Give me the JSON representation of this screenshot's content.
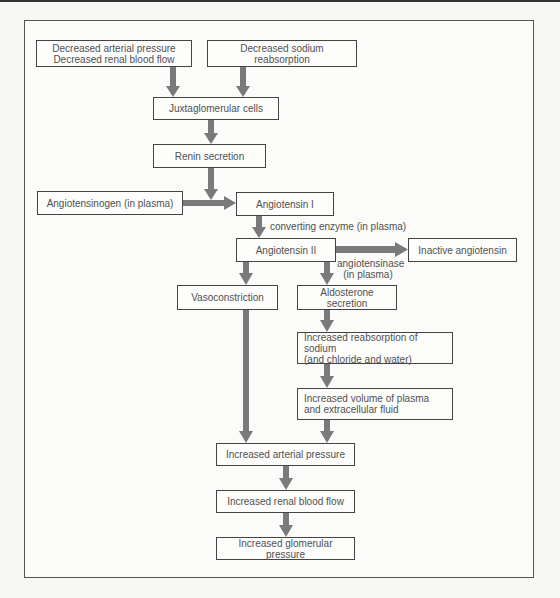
{
  "diagram": {
    "title": "",
    "nodes": {
      "decreased_pressure": {
        "line1": "Decreased arterial pressure",
        "line2": "Decreased renal blood flow"
      },
      "decreased_sodium": "Decreased sodium reabsorption",
      "juxtaglomerular": "Juxtaglomerular cells",
      "renin": "Renin secretion",
      "angiotensinogen": "Angiotensinogen (in plasma)",
      "angiotensin_i": "Angiotensin I",
      "angiotensin_ii": "Angiotensin II",
      "inactive": "Inactive angiotensin",
      "vasoconstriction": "Vasoconstriction",
      "aldosterone": "Aldosterone secretion",
      "reabsorption": {
        "line1": "Increased reabsorption of sodium",
        "line2": "(and chloride and water)"
      },
      "volume": {
        "line1": "Increased volume of plasma",
        "line2": "and extracellular fluid"
      },
      "arterial_pressure": "Increased arterial pressure",
      "renal_flow": "Increased renal blood flow",
      "glomerular": "Increased glomerular pressure"
    },
    "edge_labels": {
      "converting_enzyme": "converting enzyme (in plasma)",
      "angiotensinase_line1": "angiotensinase",
      "angiotensinase_line2": "(in plasma)"
    },
    "edges": [
      [
        "decreased_pressure",
        "juxtaglomerular"
      ],
      [
        "decreased_sodium",
        "juxtaglomerular"
      ],
      [
        "juxtaglomerular",
        "renin"
      ],
      [
        "renin",
        "angiotensin_i"
      ],
      [
        "angiotensinogen",
        "angiotensin_i"
      ],
      [
        "angiotensin_i",
        "angiotensin_ii"
      ],
      [
        "angiotensin_ii",
        "inactive"
      ],
      [
        "angiotensin_ii",
        "vasoconstriction"
      ],
      [
        "angiotensin_ii",
        "aldosterone"
      ],
      [
        "aldosterone",
        "reabsorption"
      ],
      [
        "reabsorption",
        "volume"
      ],
      [
        "volume",
        "arterial_pressure"
      ],
      [
        "vasoconstriction",
        "arterial_pressure"
      ],
      [
        "arterial_pressure",
        "renal_flow"
      ],
      [
        "renal_flow",
        "glomerular"
      ]
    ],
    "colors": {
      "arrow": "#7a7a7a",
      "box_border": "#444444",
      "text": "#505050"
    }
  }
}
